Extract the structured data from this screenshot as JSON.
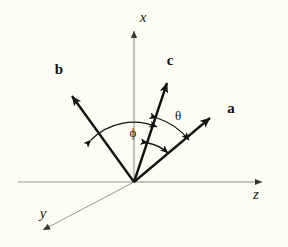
{
  "figure": {
    "type": "vector-diagram-3d-axes",
    "background_color": "#fdfdf3",
    "width": 288,
    "height": 247,
    "origin": {
      "x": 134,
      "y": 182
    }
  },
  "axes": [
    {
      "id": "x",
      "label": "x",
      "style": "italic-serif",
      "color": "#8a8a82",
      "stroke_width": 1,
      "start": {
        "x": 134,
        "y": 182
      },
      "end": {
        "x": 134,
        "y": 27
      },
      "arrowhead": true,
      "label_pos": {
        "x": 143,
        "y": 22
      }
    },
    {
      "id": "z",
      "label": "z",
      "style": "italic-serif",
      "color": "#8a8a82",
      "stroke_width": 1,
      "start": {
        "x": 134,
        "y": 182
      },
      "end": {
        "x": 265,
        "y": 182
      },
      "arrowhead": true,
      "label_pos": {
        "x": 255,
        "y": 198
      }
    },
    {
      "id": "y",
      "label": "y",
      "style": "italic-serif",
      "color": "#9a9a90",
      "stroke_width": 1,
      "start": {
        "x": 134,
        "y": 182
      },
      "end": {
        "x": 40,
        "y": 232
      },
      "arrowhead": true,
      "label_pos": {
        "x": 42,
        "y": 217
      }
    },
    {
      "id": "z-negative",
      "label": "",
      "color": "#9a9a90",
      "stroke_width": 1,
      "start": {
        "x": 134,
        "y": 182
      },
      "end": {
        "x": 18,
        "y": 182
      },
      "arrowhead": false
    }
  ],
  "vectors": [
    {
      "id": "b",
      "label": "b",
      "style": "bold-serif",
      "color": "#141412",
      "stroke_width": 2.4,
      "start": {
        "x": 134,
        "y": 182
      },
      "end": {
        "x": 68,
        "y": 90
      },
      "arrowhead": true,
      "label_pos": {
        "x": 59,
        "y": 74
      }
    },
    {
      "id": "c",
      "label": "c",
      "style": "bold-serif",
      "color": "#141412",
      "stroke_width": 2.4,
      "start": {
        "x": 134,
        "y": 182
      },
      "end": {
        "x": 170,
        "y": 76
      },
      "arrowhead": true,
      "label_pos": {
        "x": 168,
        "y": 65
      }
    },
    {
      "id": "a",
      "label": "a",
      "style": "bold-serif",
      "color": "#141412",
      "stroke_width": 2.4,
      "start": {
        "x": 134,
        "y": 182
      },
      "end": {
        "x": 216,
        "y": 113
      },
      "arrowhead": true,
      "label_pos": {
        "x": 228,
        "y": 112
      }
    }
  ],
  "angles": [
    {
      "id": "phi",
      "label": "ϕ",
      "between": [
        "b",
        "c"
      ],
      "radius": 60,
      "color": "#141412",
      "stroke_width": 1.3,
      "double_arrow": true,
      "label_pos": {
        "x": 133,
        "y": 135
      }
    },
    {
      "id": "theta",
      "label": "θ",
      "between": [
        "c",
        "a"
      ],
      "radius": 68,
      "color": "#141412",
      "stroke_width": 1.3,
      "double_arrow": true,
      "label_pos": {
        "x": 177,
        "y": 119
      }
    },
    {
      "id": "theta-inner",
      "label": "",
      "between": [
        "c",
        "a"
      ],
      "radius": 42,
      "color": "#141412",
      "stroke_width": 1.3,
      "double_arrow": true,
      "label_pos": null
    }
  ]
}
